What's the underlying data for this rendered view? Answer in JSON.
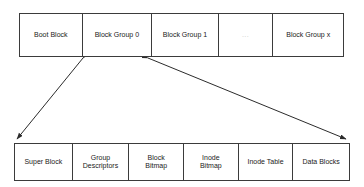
{
  "diagram": {
    "type": "block-layout-diagram",
    "background_color": "#ffffff",
    "stroke_color": "#3b3b3b",
    "text_color": "#1a1a1a",
    "faint_text_color": "#c9c9c9",
    "disk_row": {
      "name": "disk-layout-row",
      "cells": [
        {
          "label": "Boot Block",
          "faint": false
        },
        {
          "label": "Block Group 0",
          "faint": false
        },
        {
          "label": "Block Group 1",
          "faint": false
        },
        {
          "label": "...",
          "faint": true
        },
        {
          "label": "Block Group x",
          "faint": false
        }
      ]
    },
    "block_group_row": {
      "name": "block-group-detail-row",
      "cells": [
        {
          "label": "Super Block"
        },
        {
          "label": "Group\nDescriptors"
        },
        {
          "label": "Block\nBitmap"
        },
        {
          "label": "Inode\nBitmap"
        },
        {
          "label": "Inode Table"
        },
        {
          "label": "Data Blocks"
        }
      ]
    },
    "connectors": [
      {
        "name": "expansion-connector-left",
        "from_label": "Block Group 0",
        "to_label": "Super Block",
        "double_headed": true
      },
      {
        "name": "expansion-connector-right",
        "from_label": "Block Group 0",
        "to_label": "Data Blocks",
        "double_headed": true
      }
    ]
  }
}
